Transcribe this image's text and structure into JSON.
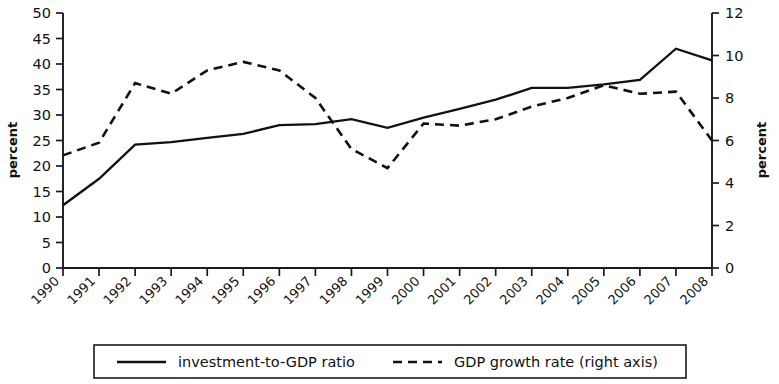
{
  "chart_data": {
    "type": "line",
    "title": "",
    "subtitle": "",
    "xlabel": "",
    "ylabel": "percent",
    "y2label": "percent",
    "grid": false,
    "legend_position": "bottom",
    "ylim": [
      0,
      50
    ],
    "y2lim": [
      0,
      12
    ],
    "yticks": [
      0,
      5,
      10,
      15,
      20,
      25,
      30,
      35,
      40,
      45,
      50
    ],
    "y2ticks": [
      0,
      2,
      4,
      6,
      8,
      10,
      12
    ],
    "ytick_labels": [
      "0",
      "5",
      "10",
      "15",
      "20",
      "25",
      "30",
      "35",
      "40",
      "45",
      "50"
    ],
    "y2tick_labels": [
      "0",
      "2",
      "4",
      "6",
      "8",
      "10",
      "12"
    ],
    "categories": [
      "1990",
      "1991",
      "1992",
      "1993",
      "1994",
      "1995",
      "1996",
      "1997",
      "1998",
      "1999",
      "2000",
      "2001",
      "2002",
      "2003",
      "2004",
      "2005",
      "2006",
      "2007",
      "2008"
    ],
    "series": [
      {
        "name": "investment-to-GDP ratio",
        "axis": "left",
        "style": "solid",
        "color": "#111111",
        "values": [
          12.3,
          17.5,
          24.2,
          24.7,
          25.5,
          26.3,
          28.0,
          28.2,
          29.2,
          27.5,
          29.5,
          31.2,
          33.0,
          35.3,
          35.3,
          36.0,
          36.9,
          43.0,
          40.7
        ]
      },
      {
        "name": "GDP growth rate (right axis)",
        "axis": "right",
        "style": "dashed",
        "color": "#111111",
        "values": [
          5.3,
          5.9,
          8.7,
          8.2,
          9.3,
          9.7,
          9.3,
          8.0,
          5.6,
          4.7,
          6.8,
          6.7,
          7.0,
          7.6,
          8.0,
          8.6,
          8.2,
          8.3,
          6.0
        ]
      }
    ]
  },
  "axes": {
    "left_title": "percent",
    "right_title": "percent"
  },
  "legend": {
    "items": [
      {
        "label": "investment-to-GDP ratio",
        "style": "solid"
      },
      {
        "label": "GDP growth rate (right axis)",
        "style": "dashed"
      }
    ]
  }
}
